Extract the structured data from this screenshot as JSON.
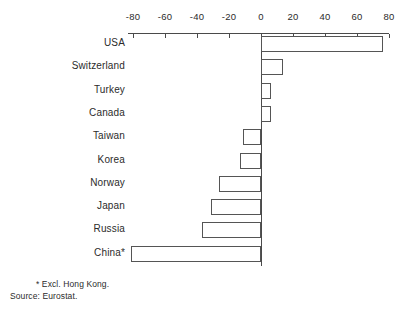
{
  "chart_data": {
    "type": "bar",
    "orientation": "horizontal",
    "title": "",
    "subtitle": "",
    "xlabel": "",
    "ylabel": "",
    "xlim": [
      -80,
      80
    ],
    "xticks": [
      -80,
      -60,
      -40,
      -20,
      0,
      20,
      40,
      60,
      80
    ],
    "xtick_labels": [
      "-80",
      "-60",
      "-40",
      "-20",
      "0",
      "20",
      "40",
      "60",
      "80"
    ],
    "grid": false,
    "legend": null,
    "axis_position": "top",
    "bar_style": {
      "fill": "#ffffff",
      "edge": "#555555"
    },
    "categories": [
      "USA",
      "Switzerland",
      "Turkey",
      "Canada",
      "Taiwan",
      "Korea",
      "Norway",
      "Japan",
      "Russia",
      "China*"
    ],
    "values": [
      76,
      14,
      6,
      6,
      -11,
      -13,
      -26,
      -31,
      -37,
      -81
    ],
    "annotations": [
      "* Excl. Hong Kong.",
      "Source: Eurostat."
    ]
  },
  "footnotes": {
    "excl": "* Excl. Hong Kong.",
    "source": "Source: Eurostat."
  },
  "colors": {
    "background": "#ffffff",
    "axis": "#4a4a4a",
    "text": "#2b2b2b",
    "bar_edge": "#555555",
    "bar_fill": "#ffffff"
  }
}
